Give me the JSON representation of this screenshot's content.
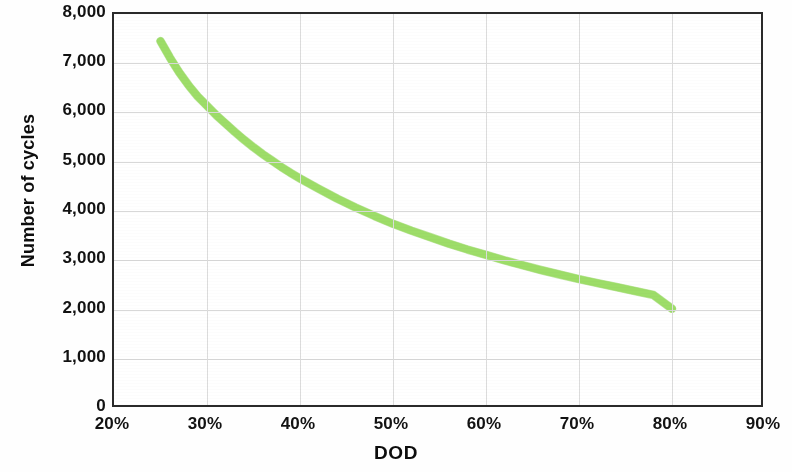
{
  "chart_data": {
    "type": "line",
    "title": "",
    "xlabel": "DOD",
    "ylabel": "Number of cycles",
    "xlim": [
      20,
      90
    ],
    "ylim": [
      0,
      8000
    ],
    "grid": true,
    "legend": "none",
    "line_color": "#9ddd68",
    "x_tick_labels": [
      "20%",
      "30%",
      "40%",
      "50%",
      "60%",
      "70%",
      "80%",
      "90%"
    ],
    "x_tick_values": [
      20,
      30,
      40,
      50,
      60,
      70,
      80,
      90
    ],
    "y_tick_labels": [
      "0",
      "1,000",
      "2,000",
      "3,000",
      "4,000",
      "5,000",
      "6,000",
      "7,000",
      "8,000"
    ],
    "y_tick_values": [
      0,
      1000,
      2000,
      3000,
      4000,
      5000,
      6000,
      7000,
      8000
    ],
    "series": [
      {
        "name": "Cycle life vs DOD",
        "x": [
          25,
          26,
          27,
          28,
          29,
          30,
          31,
          32,
          33,
          34,
          35,
          36,
          37,
          38,
          39,
          40,
          42,
          44,
          46,
          48,
          50,
          52,
          54,
          56,
          58,
          60,
          62,
          64,
          66,
          68,
          70,
          72,
          74,
          76,
          78,
          80
        ],
        "y": [
          7450,
          7120,
          6820,
          6560,
          6330,
          6140,
          5950,
          5780,
          5610,
          5450,
          5300,
          5160,
          5030,
          4900,
          4780,
          4670,
          4460,
          4260,
          4080,
          3910,
          3750,
          3610,
          3480,
          3350,
          3230,
          3120,
          3010,
          2910,
          2810,
          2720,
          2630,
          2550,
          2470,
          2390,
          2310,
          2030
        ]
      }
    ]
  }
}
